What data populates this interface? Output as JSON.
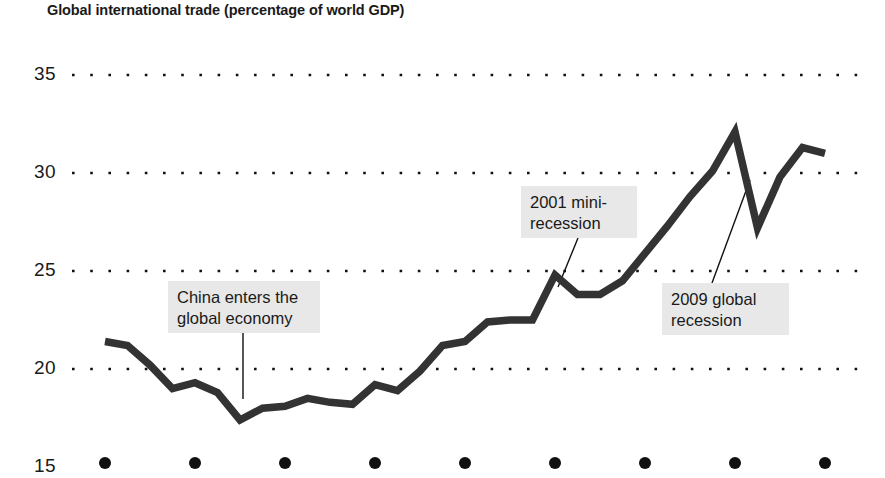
{
  "chart_data": {
    "type": "line",
    "title": "Global international trade (percentage of world GDP)",
    "xlabel": "",
    "ylabel": "",
    "xlim": [
      1979,
      2013
    ],
    "ylim": [
      15,
      36.2
    ],
    "grid": "horizontal-dotted",
    "legend": "none",
    "y_ticks": [
      "35",
      "30",
      "25",
      "20",
      "15"
    ],
    "y_tick_values": [
      35,
      30,
      25,
      20,
      15
    ],
    "x_ticks": [
      "1980",
      "1984",
      "1988",
      "1992",
      "1996",
      "2000",
      "2004",
      "2008",
      "2012"
    ],
    "x_tick_values": [
      1980,
      1984,
      1988,
      1992,
      1996,
      2000,
      2004,
      2008,
      2012
    ],
    "series": [
      {
        "name": "Global international trade",
        "color": "#333333",
        "x": [
          1980,
          1981,
          1982,
          1983,
          1984,
          1985,
          1986,
          1987,
          1988,
          1989,
          1990,
          1991,
          1992,
          1993,
          1994,
          1995,
          1996,
          1997,
          1998,
          1999,
          2000,
          2001,
          2002,
          2003,
          2004,
          2005,
          2006,
          2007,
          2008,
          2009,
          2010,
          2011,
          2012
        ],
        "values": [
          21.4,
          21.2,
          20.2,
          19.0,
          19.3,
          18.8,
          17.4,
          18.0,
          18.1,
          18.5,
          18.3,
          18.2,
          19.2,
          18.9,
          19.9,
          21.2,
          21.4,
          22.4,
          22.5,
          22.5,
          24.8,
          23.8,
          23.8,
          24.5,
          25.9,
          27.3,
          28.8,
          30.1,
          32.1,
          27.2,
          29.8,
          31.3,
          31.0
        ]
      }
    ],
    "annotations": [
      {
        "id": "china-enters",
        "text": "China enters the\nglobal economy",
        "point_year": 1986,
        "point_value": 17.4
      },
      {
        "id": "mini-recession-2001",
        "text": "2001 mini-\nrecession",
        "point_year": 2001,
        "point_value": 23.8
      },
      {
        "id": "global-recession-2009",
        "text": "2009 global\nrecession",
        "point_year": 2009,
        "point_value": 27.2
      }
    ]
  },
  "axis": {
    "y_labels": [
      {
        "text": "35"
      },
      {
        "text": "30"
      },
      {
        "text": "25"
      },
      {
        "text": "20"
      },
      {
        "text": "15"
      }
    ],
    "x_labels": [
      {
        "text": "1980"
      },
      {
        "text": "1984"
      },
      {
        "text": "1988"
      },
      {
        "text": "1992"
      },
      {
        "text": "1996"
      },
      {
        "text": "2000"
      },
      {
        "text": "2004"
      },
      {
        "text": "2008"
      },
      {
        "text": "2012"
      }
    ]
  },
  "annotations": {
    "china": "China enters the\nglobal economy",
    "recession2001": "2001 mini-\nrecession",
    "recession2009": "2009 global\nrecession"
  },
  "colors": {
    "line": "#333333",
    "gridline": "#111111",
    "annotation_background": "#e8e8e8",
    "text": "#1a1a1a",
    "background": "#ffffff"
  }
}
